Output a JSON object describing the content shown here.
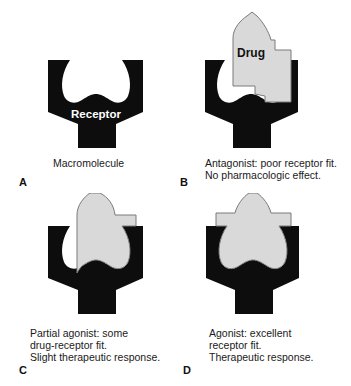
{
  "colors": {
    "receptor": "#0d0d0d",
    "drug_fill": "#d9d9d9",
    "drug_stroke": "#7a7a7a",
    "background": "#ffffff"
  },
  "panels": [
    {
      "letter": "A",
      "caption": "Macromolecule",
      "receptor_label": "Receptor",
      "drug_label": ""
    },
    {
      "letter": "B",
      "caption": "Antagonist: poor receptor fit.\nNo pharmacologic effect.",
      "receptor_label": "",
      "drug_label": "Drug"
    },
    {
      "letter": "C",
      "caption": "Partial agonist: some\ndrug-receptor fit.\nSlight therapeutic response.",
      "receptor_label": "",
      "drug_label": ""
    },
    {
      "letter": "D",
      "caption": "Agonist: excellent\nreceptor fit.\nTherapeutic response.",
      "receptor_label": "",
      "drug_label": ""
    }
  ]
}
